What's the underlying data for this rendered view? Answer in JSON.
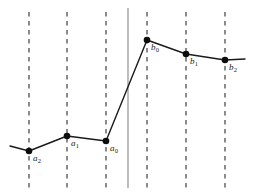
{
  "figure": {
    "title": "",
    "width": 255,
    "height": 193,
    "background_color": "#ffffff"
  },
  "chart_data": {
    "type": "line",
    "title": "",
    "xlabel": "",
    "ylabel": "",
    "grid": false,
    "legend": null,
    "axis_ranges": {
      "x": [
        0,
        255
      ],
      "y": [
        0,
        193
      ]
    },
    "note": "Piecewise-linear curve through six labeled sample points; vertical dashed gridlines mark each sample abscissa; a solid vertical line marks the boundary between the a-samples and the b-samples.",
    "series": [
      {
        "name": "curve",
        "color": "#1a1a1a",
        "points_px": [
          [
            10,
            146
          ],
          [
            29,
            151
          ],
          [
            67,
            136
          ],
          [
            106,
            141
          ],
          [
            147,
            40
          ],
          [
            186,
            54
          ],
          [
            225,
            60
          ],
          [
            245,
            59
          ]
        ]
      }
    ],
    "markers": [
      {
        "id": "a2",
        "label": "a",
        "subscript": "2",
        "x_px": 29,
        "y_px": 151,
        "label_x_px": 33,
        "label_y_px": 154
      },
      {
        "id": "a1",
        "label": "a",
        "subscript": "1",
        "x_px": 67,
        "y_px": 136,
        "label_x_px": 71,
        "label_y_px": 139
      },
      {
        "id": "a0",
        "label": "a",
        "subscript": "0",
        "x_px": 106,
        "y_px": 141,
        "label_x_px": 110,
        "label_y_px": 144
      },
      {
        "id": "b0",
        "label": "b",
        "subscript": "0",
        "x_px": 147,
        "y_px": 40,
        "label_x_px": 151,
        "label_y_px": 43
      },
      {
        "id": "b1",
        "label": "b",
        "subscript": "1",
        "x_px": 186,
        "y_px": 54,
        "label_x_px": 190,
        "label_y_px": 57
      },
      {
        "id": "b2",
        "label": "b",
        "subscript": "2",
        "x_px": 225,
        "y_px": 60,
        "label_x_px": 229,
        "label_y_px": 63
      }
    ],
    "dashed_gridlines_x_px": [
      29,
      67,
      106,
      147,
      186,
      225
    ],
    "dashed_gridline_extent_y_px": [
      12,
      188
    ],
    "dashed_gridline_color": "#4d4d4d",
    "boundary_line": {
      "x_px": 128,
      "y_top_px": 8,
      "y_bottom_px": 188,
      "color": "#888888",
      "style": "solid"
    },
    "marker_style": {
      "shape": "circle",
      "radius_px": 3.3,
      "fill": "#0d0d0d"
    },
    "line_style": {
      "color": "#1a1a1a",
      "width_px": 1.4
    }
  }
}
